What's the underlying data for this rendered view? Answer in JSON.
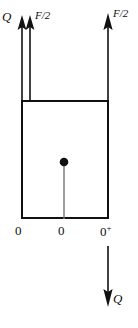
{
  "figure": {
    "background_color": "#ffffff",
    "stroke_color": "#111111",
    "width": 138,
    "height": 328
  },
  "labels": {
    "shear_top_left": "Q",
    "force_half_left": "F/2",
    "force_half_right": "F/2",
    "shear_bottom_right": "Q",
    "axis_origin_left": "0",
    "axis_origin_mid": "0",
    "axis_origin_right": "0",
    "axis_origin_right_superscript": "+"
  },
  "arrows": [
    {
      "name": "shear-arrow-left-inner",
      "direction": "up",
      "x": 22,
      "tail_y": 100,
      "head_y": 20
    },
    {
      "name": "force-arrow-left",
      "direction": "up",
      "x": 30,
      "tail_y": 100,
      "head_y": 20
    },
    {
      "name": "force-arrow-right",
      "direction": "up",
      "x": 108,
      "tail_y": 100,
      "head_y": 20
    },
    {
      "name": "shear-arrow-bottom",
      "direction": "down",
      "x": 108,
      "tail_y": 246,
      "head_y": 306
    }
  ],
  "block": {
    "name": "rectangular-block",
    "left": 22,
    "top": 101,
    "right": 108,
    "bottom": 218,
    "stroke_width": 2
  },
  "center_point": {
    "name": "centroid-dot",
    "x": 64,
    "y": 163,
    "radius": 4
  },
  "center_line": {
    "name": "centroid-vertical-line",
    "x": 64,
    "from_y": 167,
    "to_y": 218
  }
}
